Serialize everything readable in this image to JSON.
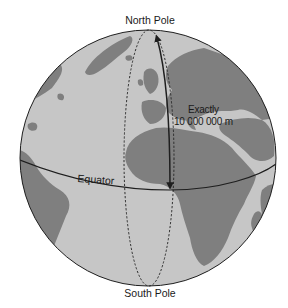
{
  "figure": {
    "labels": {
      "north_pole": "North Pole",
      "south_pole": "South Pole",
      "equator": "Equator",
      "distance_line1": "Exactly",
      "distance_line2": "10 000 000 m"
    },
    "colors": {
      "ocean": "#c6c6c6",
      "land": "#7f7f7f",
      "outline": "#1e1e1e",
      "background": "#ffffff"
    },
    "elements": {
      "globe": "sphere with continents (Europe, Africa, South America, Middle East)",
      "meridian": "dashed ellipse through North and South Poles",
      "arrow": "double-headed solid arrow from North Pole to Equator along meridian",
      "equator": "solid curved line across globe"
    }
  }
}
